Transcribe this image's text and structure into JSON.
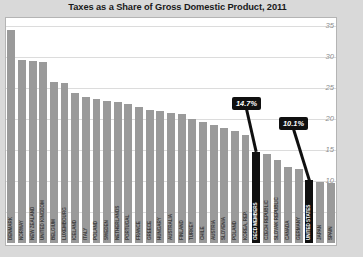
{
  "chart_data": {
    "type": "bar",
    "title": "Taxes as a Share of Gross Domestic Product, 2011",
    "xlabel": "",
    "ylabel": "TAX REVENUE (PERCENTAGE OF GDP)",
    "ylim": [
      0,
      36
    ],
    "yticks": [
      5,
      10,
      15,
      20,
      25,
      30,
      35
    ],
    "grid": true,
    "legend": "none",
    "bar_color": "#9a9a9a",
    "highlight_color": "#101010",
    "categories": [
      "DENMARK",
      "NORWAY",
      "NEW ZEALAND",
      "UNITED KINGDOM",
      "BELGIUM",
      "LUXEMBOURG",
      "ICELAND",
      "ITALY",
      "POLAND",
      "SWEDEN",
      "NETHERLANDS",
      "PORTUGAL",
      "FRANCE",
      "GREECE",
      "HUNGARY",
      "AUSTRALIA",
      "FINLAND",
      "TURKEY",
      "CHILE",
      "AUSTRIA",
      "SLOVENIA",
      "POLAND",
      "KOREA, REP.",
      "OECD MEMBERS",
      "CZECH REPUBLIC",
      "SLOVAK REPUBLIC",
      "CANADA",
      "GERMANY",
      "UNITED STATES",
      "JAPAN",
      "SPAIN"
    ],
    "values": [
      34.4,
      29.5,
      29.4,
      29.3,
      26.0,
      25.8,
      24.2,
      23.5,
      23.2,
      23.0,
      22.7,
      22.5,
      22.0,
      21.5,
      21.3,
      21.0,
      20.8,
      20.0,
      19.6,
      19.0,
      18.6,
      18.1,
      17.5,
      14.7,
      14.3,
      13.4,
      12.2,
      11.9,
      10.1,
      9.9,
      9.7
    ],
    "highlighted": [
      "OECD MEMBERS",
      "UNITED STATES"
    ],
    "annotations": [
      {
        "label": "14.7%",
        "target": "OECD MEMBERS",
        "value": 14.7
      },
      {
        "label": "10.1%",
        "target": "UNITED STATES",
        "value": 10.1
      }
    ]
  }
}
